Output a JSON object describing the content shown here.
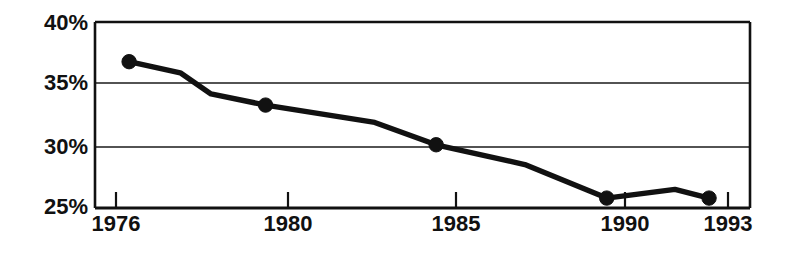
{
  "chart_data": {
    "type": "line",
    "title": "",
    "subtitle": "",
    "xlabel": "",
    "ylabel": "",
    "grid": true,
    "legend": false,
    "legend_position": "none",
    "x": [
      1976,
      1980,
      1985,
      1990,
      1993
    ],
    "xlim": [
      1975.0,
      1994.2
    ],
    "ylim": [
      25,
      40
    ],
    "yticks": [
      25,
      30,
      35,
      40
    ],
    "ytick_labels": [
      "25%",
      "30%",
      "35%",
      "40%"
    ],
    "xtick_labels": [
      "1976",
      "1980",
      "1985",
      "1990",
      "1993"
    ],
    "series": [
      {
        "name": "series-1",
        "marker": "filled-circle",
        "color": "#111111",
        "values": [
          36.8,
          33.3,
          30.1,
          25.8,
          25.8
        ],
        "vertices": [
          {
            "x": 1976.0,
            "y": 36.8,
            "marker": true
          },
          {
            "x": 1977.5,
            "y": 35.9,
            "marker": false
          },
          {
            "x": 1978.4,
            "y": 34.2,
            "marker": false
          },
          {
            "x": 1980.0,
            "y": 33.3,
            "marker": true
          },
          {
            "x": 1983.2,
            "y": 31.9,
            "marker": false
          },
          {
            "x": 1985.0,
            "y": 30.1,
            "marker": true
          },
          {
            "x": 1987.6,
            "y": 28.5,
            "marker": false
          },
          {
            "x": 1990.0,
            "y": 25.8,
            "marker": true
          },
          {
            "x": 1992.0,
            "y": 26.5,
            "marker": false
          },
          {
            "x": 1993.0,
            "y": 25.8,
            "marker": true
          }
        ]
      }
    ]
  },
  "axis": {
    "y_tick_0": "25%",
    "y_tick_1": "30%",
    "y_tick_2": "35%",
    "y_tick_3": "40%",
    "x_tick_0": "1976",
    "x_tick_1": "1980",
    "x_tick_2": "1985",
    "x_tick_3": "1990",
    "x_tick_4": "1993"
  },
  "colors": {
    "line": "#111111",
    "grid": "#1a1a1a",
    "frame": "#111111",
    "background": "#ffffff",
    "text": "#111111"
  }
}
